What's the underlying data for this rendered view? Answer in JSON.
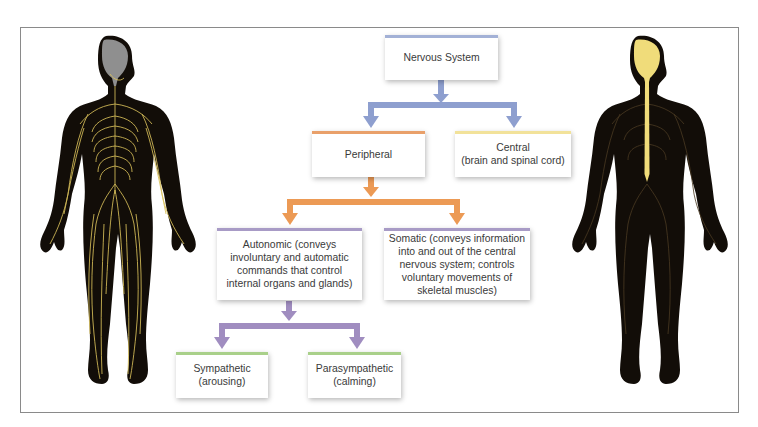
{
  "diagram": {
    "title": "Nervous System",
    "colors": {
      "nervous_system": "#a3b1d6",
      "peripheral": "#e9a06a",
      "central": "#f2e29a",
      "autonomic": "#a89bc6",
      "somatic": "#a89bc6",
      "sympathetic": "#a9d08a",
      "parasympathetic": "#a9d08a",
      "connector_level1": "#8e9fcf",
      "connector_level2": "#ec9a55",
      "connector_level3": "#a08dc0",
      "body_fill": "#120d08",
      "peripheral_nerves": "#d8bf5a",
      "brain_left": "#8f8f8f",
      "brain_right": "#f0dc7a"
    },
    "nodes": {
      "root": {
        "label": "Nervous System"
      },
      "peripheral": {
        "label": "Peripheral"
      },
      "central": {
        "label_line1": "Central",
        "label_line2": "(brain and spinal cord)"
      },
      "autonomic": {
        "label": "Autonomic (conveys involuntary and automatic commands that control internal organs and glands)"
      },
      "somatic": {
        "label": "Somatic (conveys information into and out of the central nervous system; controls voluntary movements of skeletal muscles)"
      },
      "sympathetic": {
        "label_line1": "Sympathetic",
        "label_line2": "(arousing)"
      },
      "parasympathetic": {
        "label_line1": "Parasympathetic",
        "label_line2": "(calming)"
      }
    },
    "edges": [
      [
        "Nervous System",
        "Peripheral"
      ],
      [
        "Nervous System",
        "Central"
      ],
      [
        "Peripheral",
        "Autonomic"
      ],
      [
        "Peripheral",
        "Somatic"
      ],
      [
        "Autonomic",
        "Sympathetic"
      ],
      [
        "Autonomic",
        "Parasympathetic"
      ]
    ],
    "figures": {
      "left": "peripheral-nervous-system-figure",
      "right": "central-nervous-system-figure"
    }
  }
}
